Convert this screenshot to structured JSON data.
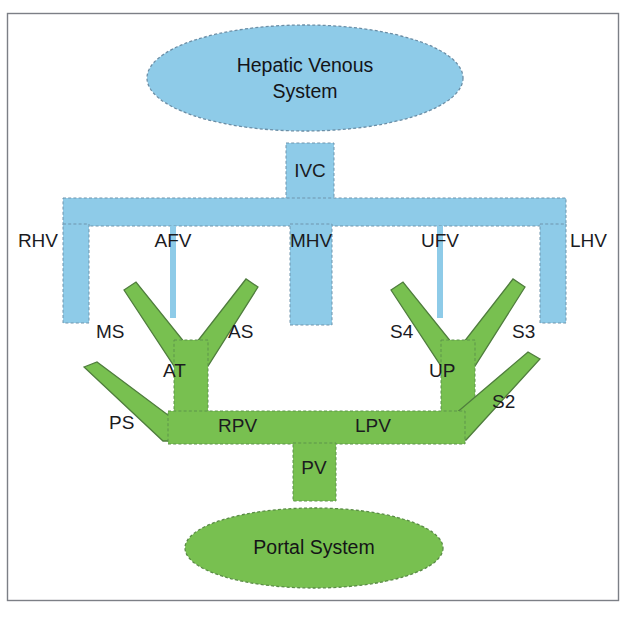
{
  "diagram": {
    "background_color": "#ffffff",
    "frame": {
      "stroke_color": "#7c7f86",
      "x": 7,
      "y": 13,
      "width": 612,
      "height": 588
    },
    "colors": {
      "venous_blue": "#8ecbe8",
      "venous_blue_stroke": "#6b8ea6",
      "portal_green": "#78c050",
      "portal_green_stroke": "#5a8c46",
      "text": "#1b1b1f"
    },
    "nodes": [
      {
        "id": "hepatic-venous-system",
        "label_line1": "Hepatic Venous",
        "label_line2": "System",
        "color": "#8ecbe8",
        "shape": "ellipse",
        "cx": 305,
        "cy": 78,
        "rx": 158,
        "ry": 53
      },
      {
        "id": "portal-system",
        "label_line1": "Portal System",
        "label_line2": "",
        "color": "#78c050",
        "shape": "ellipse",
        "cx": 314,
        "cy": 548,
        "rx": 129,
        "ry": 40
      }
    ],
    "venous_segments": [
      {
        "id": "ivc",
        "label": "IVC",
        "label_x": 310,
        "label_y": 172,
        "anchor": "middle"
      },
      {
        "id": "rhv",
        "label": "RHV",
        "label_x": 58,
        "label_y": 242,
        "anchor": "end"
      },
      {
        "id": "afv",
        "label": "AFV",
        "label_x": 173,
        "label_y": 242,
        "anchor": "middle"
      },
      {
        "id": "mhv",
        "label": "MHV",
        "label_x": 311,
        "label_y": 242,
        "anchor": "middle"
      },
      {
        "id": "ufv",
        "label": "UFV",
        "label_x": 440,
        "label_y": 242,
        "anchor": "middle"
      },
      {
        "id": "lhv",
        "label": "LHV",
        "label_x": 570,
        "label_y": 242,
        "anchor": "start"
      }
    ],
    "portal_segments": [
      {
        "id": "ms",
        "label": "MS",
        "label_x": 96,
        "label_y": 333,
        "anchor": "start"
      },
      {
        "id": "as",
        "label": "AS",
        "label_x": 228,
        "label_y": 333,
        "anchor": "start"
      },
      {
        "id": "s4",
        "label": "S4",
        "label_x": 390,
        "label_y": 333,
        "anchor": "start"
      },
      {
        "id": "s3",
        "label": "S3",
        "label_x": 512,
        "label_y": 333,
        "anchor": "start"
      },
      {
        "id": "at",
        "label": "AT",
        "label_x": 163,
        "label_y": 372,
        "anchor": "start"
      },
      {
        "id": "up",
        "label": "UP",
        "label_x": 429,
        "label_y": 372,
        "anchor": "start"
      },
      {
        "id": "s2",
        "label": "S2",
        "label_x": 492,
        "label_y": 403,
        "anchor": "start"
      },
      {
        "id": "ps",
        "label": "PS",
        "label_x": 109,
        "label_y": 424,
        "anchor": "start"
      },
      {
        "id": "rpv",
        "label": "RPV",
        "label_x": 218,
        "label_y": 427,
        "anchor": "start"
      },
      {
        "id": "lpv",
        "label": "LPV",
        "label_x": 355,
        "label_y": 427,
        "anchor": "start"
      },
      {
        "id": "pv",
        "label": "PV",
        "label_x": 314,
        "label_y": 469,
        "anchor": "middle"
      }
    ],
    "legend_note": ""
  }
}
